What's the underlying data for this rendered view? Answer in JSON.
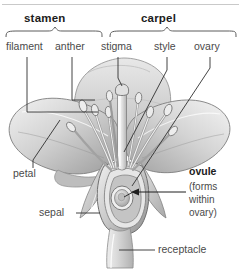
{
  "diagram": {
    "title_rule": "",
    "background": "#ffffff",
    "ink": "#4a4a4a",
    "bold_ink": "#1c1c1c"
  },
  "groups": [
    {
      "id": "stamen",
      "label": "stamen"
    },
    {
      "id": "carpel",
      "label": "carpel"
    }
  ],
  "parts": [
    {
      "id": "filament",
      "label": "filament"
    },
    {
      "id": "anther",
      "label": "anther"
    },
    {
      "id": "stigma",
      "label": "stigma"
    },
    {
      "id": "style",
      "label": "style"
    },
    {
      "id": "ovary",
      "label": "ovary"
    },
    {
      "id": "petal",
      "label": "petal"
    },
    {
      "id": "sepal",
      "label": "sepal"
    },
    {
      "id": "receptacle",
      "label": "receptacle"
    }
  ],
  "callout": {
    "title": "ovule",
    "line1": "(forms",
    "line2": "within",
    "line3": "ovary)"
  },
  "icons": {
    "ovule_arrow": "arrow-right-icon",
    "stamen_brace": "curly-brace-icon",
    "carpel_brace": "curly-brace-icon"
  }
}
